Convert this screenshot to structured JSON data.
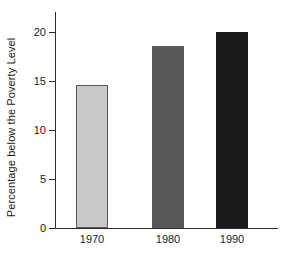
{
  "chart_data": {
    "type": "bar",
    "title": "",
    "subtitle": "",
    "xlabel": "",
    "ylabel": "Percentage below the Poverty Level",
    "categories": [
      "1970",
      "1980",
      "1990"
    ],
    "values": [
      14.6,
      18.6,
      20.0
    ],
    "series": [
      {
        "name": "Percentage below the Poverty Level",
        "values": [
          14.6,
          18.6,
          20.0
        ]
      }
    ],
    "bar_colors": [
      "#c8c8c8",
      "#575757",
      "#1a1a1a"
    ],
    "bar_border_color": "#5a5a5a",
    "ylim": [
      0,
      21.5
    ],
    "yticks": [
      0,
      5,
      10,
      15,
      20
    ],
    "ytick_labels": [
      "0",
      "5",
      "10",
      "15",
      "20"
    ],
    "xtick_labels": [
      "1970",
      "1980",
      "1990"
    ],
    "grid": false,
    "legend": "none",
    "axis_color": "#2b2b2b",
    "background_color": "#ffffff"
  },
  "axis": {
    "y_title": "Percentage below the Poverty Level",
    "ticks": [
      {
        "label": "20",
        "value": 20
      },
      {
        "label": "15",
        "value": 15
      },
      {
        "label": "10",
        "value": 10
      },
      {
        "label": "5",
        "value": 5
      },
      {
        "label": "0",
        "value": 0
      }
    ]
  },
  "bars": [
    {
      "label": "1970",
      "value": 14.6,
      "color": "#c8c8c8"
    },
    {
      "label": "1980",
      "value": 18.6,
      "color": "#575757"
    },
    {
      "label": "1990",
      "value": 20.0,
      "color": "#1a1a1a"
    }
  ]
}
